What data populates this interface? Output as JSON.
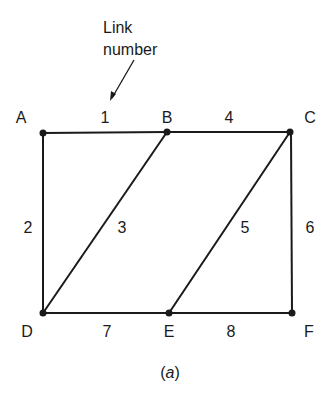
{
  "annotation": {
    "line1": "Link",
    "line2": "number"
  },
  "caption": {
    "open": "(",
    "letter": "a",
    "close": ")"
  },
  "nodes": [
    {
      "id": "A",
      "x": 43,
      "y": 133
    },
    {
      "id": "B",
      "x": 167,
      "y": 132
    },
    {
      "id": "C",
      "x": 290,
      "y": 132
    },
    {
      "id": "D",
      "x": 43,
      "y": 313
    },
    {
      "id": "E",
      "x": 169,
      "y": 313
    },
    {
      "id": "F",
      "x": 292,
      "y": 313
    }
  ],
  "links": [
    {
      "number": "1",
      "from": "A",
      "to": "B"
    },
    {
      "number": "2",
      "from": "A",
      "to": "D"
    },
    {
      "number": "3",
      "from": "B",
      "to": "D"
    },
    {
      "number": "4",
      "from": "B",
      "to": "C"
    },
    {
      "number": "5",
      "from": "C",
      "to": "E"
    },
    {
      "number": "6",
      "from": "C",
      "to": "F"
    },
    {
      "number": "7",
      "from": "D",
      "to": "E"
    },
    {
      "number": "8",
      "from": "E",
      "to": "F"
    }
  ],
  "colors": {
    "line": "#1a1a1a",
    "background": "#ffffff"
  }
}
